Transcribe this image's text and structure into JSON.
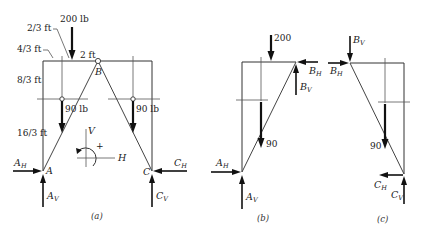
{
  "diagram": {
    "panels": [
      {
        "id": "a",
        "caption": "(a)",
        "loads": {
          "top_load": "200 lb",
          "left_hanging": "90 lb",
          "right_hanging": "90 lb"
        },
        "dimensions": {
          "d1": "2/3 ft",
          "d2": "4/3 ft",
          "d3": "2 ft",
          "d4": "8/3 ft",
          "d5": "16/3 ft"
        },
        "points": {
          "A": "A",
          "B": "B",
          "C": "C"
        },
        "reactions": {
          "AH": {
            "main": "A",
            "sub": "H"
          },
          "AV": {
            "main": "A",
            "sub": "V"
          },
          "CH": {
            "main": "C",
            "sub": "H"
          },
          "CV": {
            "main": "C",
            "sub": "V"
          }
        },
        "sign_convention": {
          "vertical": "V",
          "horizontal": "H",
          "moment": "+"
        }
      },
      {
        "id": "b",
        "caption": "(b)",
        "loads": {
          "top_load": "200",
          "hanging": "90"
        },
        "reactions": {
          "AH": {
            "main": "A",
            "sub": "H"
          },
          "AV": {
            "main": "A",
            "sub": "V"
          },
          "BH": {
            "main": "B",
            "sub": "H"
          },
          "BV": {
            "main": "B",
            "sub": "V"
          }
        }
      },
      {
        "id": "c",
        "caption": "(c)",
        "loads": {
          "hanging": "90"
        },
        "reactions": {
          "BH": {
            "main": "B",
            "sub": "H"
          },
          "BV": {
            "main": "B",
            "sub": "V"
          },
          "CH": {
            "main": "C",
            "sub": "H"
          },
          "CV": {
            "main": "C",
            "sub": "V"
          }
        }
      }
    ]
  }
}
